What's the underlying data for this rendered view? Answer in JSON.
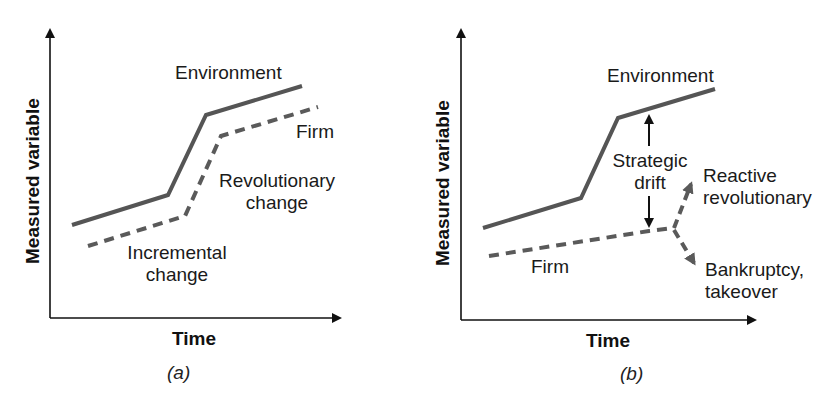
{
  "colors": {
    "axis": "#111111",
    "environment_line": "#555555",
    "firm_line": "#5a5a5a",
    "drift_arrow": "#111111",
    "text": "#1a1a1a"
  },
  "panel_a": {
    "tag": "(a)",
    "x_axis_label": "Time",
    "y_axis_label": "Measured variable",
    "environment_label": "Environment",
    "firm_label": "Firm",
    "revolutionary_label_1": "Revolutionary",
    "revolutionary_label_2": "change",
    "incremental_label_1": "Incremental",
    "incremental_label_2": "change"
  },
  "panel_b": {
    "tag": "(b)",
    "x_axis_label": "Time",
    "y_axis_label": "Measured variable",
    "environment_label": "Environment",
    "firm_label": "Firm",
    "drift_label_1": "Strategic",
    "drift_label_2": "drift",
    "reactive_label_1": "Reactive",
    "reactive_label_2": "revolutionary",
    "bankruptcy_label_1": "Bankruptcy,",
    "bankruptcy_label_2": "takeover"
  }
}
